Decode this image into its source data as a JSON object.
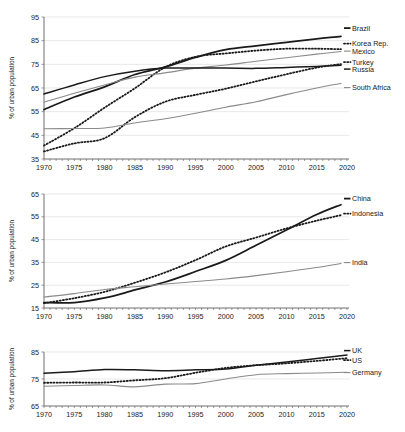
{
  "figure": {
    "y_axis_title": "% of urban population",
    "panel_count": 3
  },
  "chart_data": [
    {
      "type": "line",
      "title": "",
      "xlabel": "",
      "ylabel": "% of urban population",
      "xlim": [
        1970,
        2020
      ],
      "ylim": [
        35,
        95
      ],
      "yticks": [
        35,
        45,
        55,
        65,
        75,
        85,
        95
      ],
      "xticks": [
        1970,
        1975,
        1980,
        1985,
        1990,
        1995,
        2000,
        2005,
        2010,
        2015,
        2020
      ],
      "grid": true,
      "legend_position": "right-of-plot",
      "x": [
        1970,
        1975,
        1980,
        1985,
        1990,
        1995,
        2000,
        2005,
        2010,
        2015,
        2019
      ],
      "series": [
        {
          "name": "Brazil",
          "style": "solid",
          "color": "#1a1a1a",
          "width": 1.8,
          "values": [
            55.9,
            61.2,
            65.5,
            70.7,
            73.9,
            77.9,
            81.2,
            82.8,
            84.3,
            85.8,
            86.8
          ]
        },
        {
          "name": "Korea Rep.",
          "style": "dotted",
          "color": "#1a1a1a",
          "width": 1.8,
          "values": [
            40.7,
            48.0,
            56.7,
            64.9,
            73.8,
            78.2,
            79.6,
            80.8,
            81.6,
            81.6,
            81.4
          ]
        },
        {
          "name": "Mexico",
          "style": "solid",
          "color": "#8a8a8a",
          "width": 1.1,
          "values": [
            59.0,
            62.8,
            66.3,
            69.6,
            71.4,
            73.4,
            74.7,
            76.3,
            77.8,
            79.3,
            80.4
          ]
        },
        {
          "name": "Turkey",
          "style": "dotted",
          "color": "#1a1a1a",
          "width": 1.8,
          "values": [
            38.2,
            41.6,
            43.8,
            52.7,
            59.2,
            62.1,
            64.7,
            67.8,
            70.8,
            73.6,
            75.1
          ]
        },
        {
          "name": "Russia",
          "style": "solid",
          "color": "#1a1a1a",
          "width": 1.5,
          "values": [
            62.5,
            66.3,
            69.8,
            72.1,
            73.4,
            73.4,
            73.4,
            73.3,
            73.7,
            74.1,
            74.6
          ]
        },
        {
          "name": "South Africa",
          "style": "solid",
          "color": "#8a8a8a",
          "width": 1.1,
          "values": [
            47.8,
            47.9,
            48.1,
            50.2,
            52.0,
            54.3,
            56.9,
            59.2,
            62.2,
            65.0,
            66.9
          ]
        }
      ]
    },
    {
      "type": "line",
      "title": "",
      "xlabel": "",
      "ylabel": "% of urban population",
      "xlim": [
        1970,
        2020
      ],
      "ylim": [
        15,
        65
      ],
      "yticks": [
        15,
        25,
        35,
        45,
        55,
        65
      ],
      "xticks": [
        1970,
        1975,
        1980,
        1985,
        1990,
        1995,
        2000,
        2005,
        2010,
        2015,
        2020
      ],
      "grid": true,
      "legend_position": "right-of-plot",
      "x": [
        1970,
        1975,
        1980,
        1985,
        1990,
        1995,
        2000,
        2005,
        2010,
        2015,
        2019
      ],
      "series": [
        {
          "name": "China",
          "style": "solid",
          "color": "#1a1a1a",
          "width": 1.8,
          "values": [
            17.4,
            17.4,
            19.4,
            22.9,
            26.4,
            31.0,
            35.9,
            42.5,
            49.2,
            56.0,
            60.3
          ]
        },
        {
          "name": "Indonesia",
          "style": "dotted",
          "color": "#1a1a1a",
          "width": 1.8,
          "values": [
            17.1,
            19.3,
            22.1,
            26.1,
            30.6,
            36.0,
            42.0,
            45.9,
            49.9,
            53.3,
            55.7
          ]
        },
        {
          "name": "India",
          "style": "solid",
          "color": "#8a8a8a",
          "width": 1.1,
          "values": [
            19.8,
            21.3,
            23.1,
            24.3,
            25.5,
            26.6,
            27.7,
            29.2,
            30.9,
            32.8,
            34.5
          ]
        }
      ]
    },
    {
      "type": "line",
      "title": "",
      "xlabel": "",
      "ylabel": "% of urban population",
      "xlim": [
        1970,
        2020
      ],
      "ylim": [
        65,
        85
      ],
      "yticks": [
        65,
        75,
        85
      ],
      "xticks": [
        1970,
        1975,
        1980,
        1985,
        1990,
        1995,
        2000,
        2005,
        2010,
        2015,
        2020
      ],
      "grid": true,
      "legend_position": "right-of-plot",
      "x": [
        1970,
        1975,
        1980,
        1985,
        1990,
        1995,
        2000,
        2005,
        2010,
        2015,
        2020
      ],
      "series": [
        {
          "name": "UK",
          "style": "solid",
          "color": "#1a1a1a",
          "width": 1.5,
          "values": [
            77.1,
            77.7,
            78.5,
            78.4,
            78.1,
            78.4,
            78.7,
            80.1,
            81.3,
            82.6,
            83.9
          ]
        },
        {
          "name": "US",
          "style": "dotted",
          "color": "#1a1a1a",
          "width": 1.8,
          "values": [
            73.6,
            73.7,
            73.7,
            74.5,
            75.3,
            77.3,
            79.1,
            80.1,
            80.8,
            81.7,
            82.7
          ]
        },
        {
          "name": "Germany",
          "style": "solid",
          "color": "#8a8a8a",
          "width": 1.1,
          "values": [
            72.3,
            72.6,
            72.8,
            72.1,
            73.1,
            73.3,
            75.0,
            76.6,
            77.0,
            77.2,
            77.5
          ]
        }
      ]
    }
  ]
}
